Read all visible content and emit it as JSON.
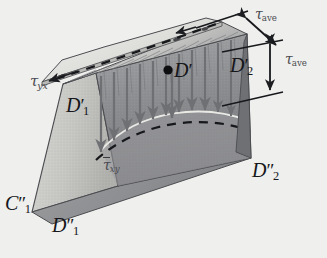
{
  "figure": {
    "background_color": "#efefed"
  },
  "labels": {
    "tau_yx": {
      "tau": "τ",
      "sub": "yx",
      "name": "shear-stress-tau-yx"
    },
    "tau_xy_bar": {
      "tau": "τ",
      "sub": "xy",
      "name": "average-shear-stress-tau-xy"
    },
    "tau_ave_top": {
      "tau": "τ",
      "sub": "ave",
      "name": "tau-ave-top"
    },
    "tau_ave_right": {
      "tau": "τ",
      "sub": "ave",
      "name": "tau-ave-right"
    },
    "D_prime": {
      "letter": "D",
      "prime": "′",
      "sub": "",
      "name": "point-D-prime"
    },
    "D1_prime": {
      "letter": "D",
      "prime": "′",
      "sub": "1",
      "name": "vertex-D1-prime"
    },
    "D1_dprime": {
      "letter": "D",
      "prime": "″",
      "sub": "1",
      "name": "vertex-D1-double-prime"
    },
    "D2_prime": {
      "letter": "D",
      "prime": "′",
      "sub": "2",
      "name": "dimension-D2-prime"
    },
    "D2_dprime": {
      "letter": "D",
      "prime": "″",
      "sub": "2",
      "name": "vertex-D2-double-prime"
    },
    "C1_dprime": {
      "letter": "C",
      "prime": "″",
      "sub": "1",
      "name": "vertex-C1-double-prime"
    }
  },
  "colors": {
    "outline": "#3a3b40",
    "face_left": "#c9c9c7",
    "face_front": "#b8b8b6",
    "face_right": "#8f9093",
    "face_top": "#dededb",
    "flange_top": "#e6e6e3",
    "arrow": "#6f7074",
    "dash": "#1c1d20",
    "text": "#16171a"
  },
  "geometry": {
    "note": "trapezoidal prism with top flange plate, parabolic shear distribution curve, nine downward stress arrows"
  }
}
